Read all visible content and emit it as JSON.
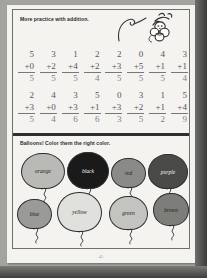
{
  "worksheet": {
    "instruction_top": "More practice with addition.",
    "instruction_balloons": "Balloons!  Color them the right color.",
    "page_number": "45",
    "doodle_name": "monkey-illustration"
  },
  "math": {
    "rows": [
      {
        "problems": [
          {
            "top": "5",
            "addend": "+0",
            "answer": "5"
          },
          {
            "top": "3",
            "addend": "+2",
            "answer": "5"
          },
          {
            "top": "1",
            "addend": "+4",
            "answer": "5"
          },
          {
            "top": "2",
            "addend": "+2",
            "answer": "4"
          },
          {
            "top": "2",
            "addend": "+3",
            "answer": "5"
          },
          {
            "top": "0",
            "addend": "+5",
            "answer": "5"
          },
          {
            "top": "4",
            "addend": "+1",
            "answer": "5"
          },
          {
            "top": "3",
            "addend": "+1",
            "answer": "4"
          }
        ]
      },
      {
        "problems": [
          {
            "top": "2",
            "addend": "+3",
            "answer": "5"
          },
          {
            "top": "4",
            "addend": "+0",
            "answer": "4"
          },
          {
            "top": "3",
            "addend": "+3",
            "answer": "6"
          },
          {
            "top": "5",
            "addend": "+1",
            "answer": "6"
          },
          {
            "top": "0",
            "addend": "+3",
            "answer": "3"
          },
          {
            "top": "3",
            "addend": "+2",
            "answer": "5"
          },
          {
            "top": "1",
            "addend": "+1",
            "answer": "2"
          },
          {
            "top": "5",
            "addend": "+4",
            "answer": "9"
          }
        ]
      }
    ]
  },
  "balloons": {
    "row1": [
      {
        "label": "orange",
        "fill": "#b9b9b6",
        "text_tone": "dark"
      },
      {
        "label": "black",
        "fill": "#1a1a1a",
        "text_tone": "light"
      },
      {
        "label": "red",
        "fill": "#8a8a88",
        "text_tone": "dark"
      },
      {
        "label": "purple",
        "fill": "#4a4a48",
        "text_tone": "light"
      }
    ],
    "row2": [
      {
        "label": "blue",
        "fill": "#9a9a98",
        "text_tone": "dark"
      },
      {
        "label": "yellow",
        "fill": "#e0e0dc",
        "text_tone": "dark"
      },
      {
        "label": "green",
        "fill": "#c3c3c0",
        "text_tone": "dark"
      },
      {
        "label": "brown",
        "fill": "#7d7d7a",
        "text_tone": "dark"
      }
    ]
  }
}
